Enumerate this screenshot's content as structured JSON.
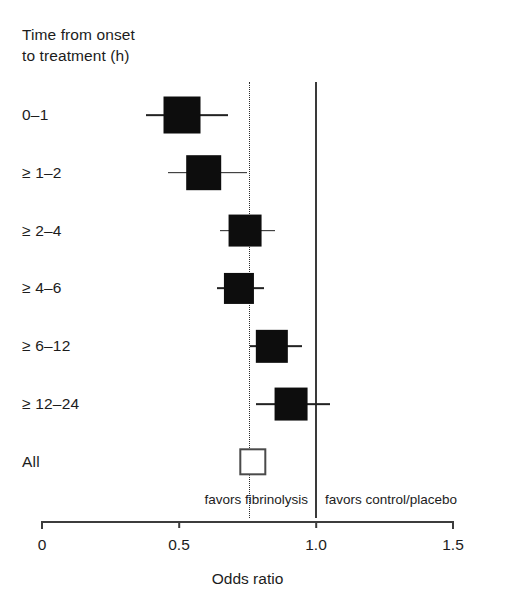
{
  "chart_data": {
    "type": "scatter",
    "subtype": "forest-plot",
    "title": "",
    "header_label": "Time from onset\nto treatment (h)",
    "xlabel": "Odds ratio",
    "ylabel": "",
    "xlim": [
      0,
      1.5
    ],
    "xticks": [
      0,
      0.5,
      1.0,
      1.5
    ],
    "xtick_labels": [
      "0",
      "0.5",
      "1.0",
      "1.5"
    ],
    "grid": false,
    "reference_line": 1.0,
    "pooled_line": 0.76,
    "annotations": {
      "favors_left": "favors fibrinolysis",
      "favors_right": "favors control/placebo"
    },
    "categories": [
      "0–1",
      "≥ 1–2",
      "≥ 2–4",
      "≥ 4–6",
      "≥ 6–12",
      "≥ 12–24",
      "All"
    ],
    "points": [
      {
        "label": "0–1",
        "odds_ratio": 0.51,
        "ci_low": 0.38,
        "ci_high": 0.68,
        "marker": "filled",
        "marker_size": 0.135
      },
      {
        "label": "≥ 1–2",
        "odds_ratio": 0.59,
        "ci_low": 0.46,
        "ci_high": 0.75,
        "marker": "filled",
        "marker_size": 0.13
      },
      {
        "label": "≥ 2–4",
        "odds_ratio": 0.74,
        "ci_low": 0.65,
        "ci_high": 0.85,
        "marker": "filled",
        "marker_size": 0.12
      },
      {
        "label": "≥ 4–6",
        "odds_ratio": 0.72,
        "ci_low": 0.64,
        "ci_high": 0.81,
        "marker": "filled",
        "marker_size": 0.11
      },
      {
        "label": "≥ 6–12",
        "odds_ratio": 0.84,
        "ci_low": 0.76,
        "ci_high": 0.95,
        "marker": "filled",
        "marker_size": 0.118
      },
      {
        "label": "≥ 12–24",
        "odds_ratio": 0.91,
        "ci_low": 0.78,
        "ci_high": 1.05,
        "marker": "filled",
        "marker_size": 0.12
      },
      {
        "label": "All",
        "odds_ratio": 0.77,
        "ci_low": 0.74,
        "ci_high": 0.8,
        "marker": "hollow",
        "marker_size": 0.1
      }
    ]
  },
  "colors": {
    "marker_fill": "#0d0d0d",
    "marker_hollow_stroke": "#4a4a4a",
    "axis": "#3c3c3c",
    "text": "#1c1c1c",
    "reference_line": "#3a3a3a",
    "pooled_line": "#2b2b2b",
    "background": "#ffffff"
  }
}
